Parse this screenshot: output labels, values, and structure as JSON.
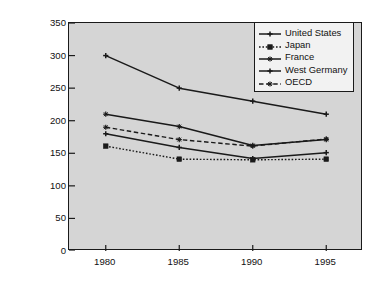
{
  "chart_data": {
    "type": "line",
    "title": "",
    "subtitle": "",
    "xlabel": "",
    "ylabel": "Energy Consumption per Unit of GDP (1991 = 100)",
    "x": [
      1980,
      1985,
      1990,
      1995
    ],
    "x_tick_labels": [
      "1980",
      "1985",
      "1990",
      "1995"
    ],
    "xlim": [
      1977.5,
      1997.5
    ],
    "ylim": [
      0,
      350
    ],
    "y_ticks": [
      0,
      50,
      100,
      150,
      200,
      250,
      300,
      350
    ],
    "y_tick_labels": [
      "0",
      "50",
      "100",
      "150",
      "200",
      "250",
      "300",
      "350"
    ],
    "grid": false,
    "legend_position": "top-right",
    "series": [
      {
        "name": "United States",
        "values": [
          300,
          250,
          230,
          210
        ],
        "line_style": "solid",
        "marker": "plus",
        "color": "#1a1a1a"
      },
      {
        "name": "Japan",
        "values": [
          161,
          141,
          140,
          141
        ],
        "line_style": "dotted",
        "marker": "square",
        "color": "#1a1a1a"
      },
      {
        "name": "France",
        "values": [
          210,
          191,
          162,
          171
        ],
        "line_style": "solid",
        "marker": "star",
        "color": "#1a1a1a"
      },
      {
        "name": "West Germany",
        "values": [
          180,
          159,
          142,
          151
        ],
        "line_style": "solid",
        "marker": "plus",
        "color": "#1a1a1a"
      },
      {
        "name": "OECD",
        "values": [
          190,
          171,
          161,
          172
        ],
        "line_style": "dashed",
        "marker": "star",
        "color": "#1a1a1a"
      }
    ]
  },
  "style": {
    "plot_background": "#d5d5d5",
    "figure_background": "#ffffff",
    "axis_color": "#1a1a1a",
    "legend_background": "#f2f2f2"
  }
}
